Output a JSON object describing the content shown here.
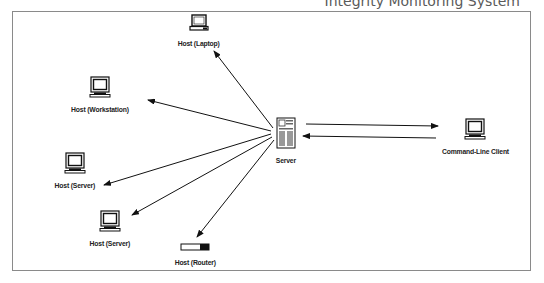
{
  "header": {
    "title_fragment": "Integrity Monitoring System"
  },
  "diagram": {
    "type": "network",
    "nodes": [
      {
        "id": "laptop",
        "label": "Host (Laptop)",
        "icon": "laptop-icon"
      },
      {
        "id": "workstation",
        "label": "Host (Workstation)",
        "icon": "monitor-icon"
      },
      {
        "id": "server1",
        "label": "Host (Server)",
        "icon": "monitor-icon"
      },
      {
        "id": "server2",
        "label": "Host (Server)",
        "icon": "monitor-icon"
      },
      {
        "id": "router",
        "label": "Host (Router)",
        "icon": "router-icon"
      },
      {
        "id": "server",
        "label": "Server",
        "icon": "server-tower-icon"
      },
      {
        "id": "client",
        "label": "Command-Line Client",
        "icon": "monitor-icon"
      }
    ],
    "edges": [
      {
        "from": "server",
        "to": "laptop"
      },
      {
        "from": "server",
        "to": "workstation"
      },
      {
        "from": "server",
        "to": "server1"
      },
      {
        "from": "server",
        "to": "server2"
      },
      {
        "from": "server",
        "to": "router"
      },
      {
        "from": "server",
        "to": "client"
      },
      {
        "from": "client",
        "to": "server"
      }
    ]
  }
}
